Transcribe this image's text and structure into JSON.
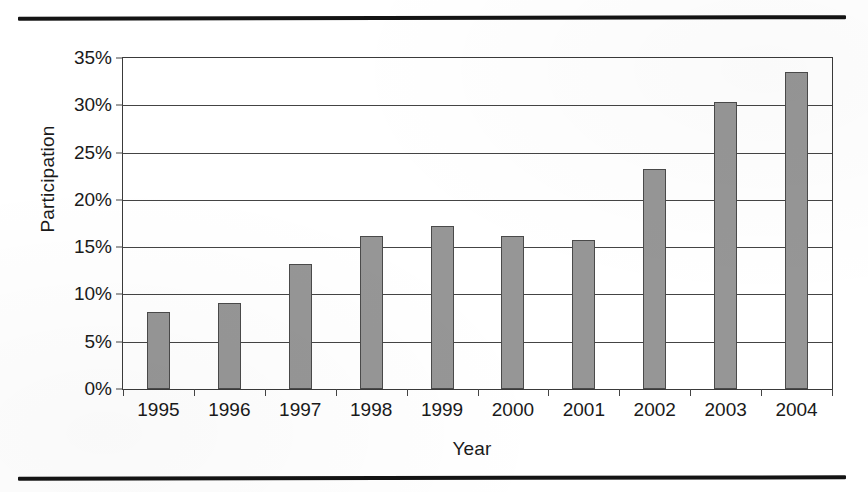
{
  "chart_data": {
    "type": "bar",
    "title": "",
    "xlabel": "Year",
    "ylabel": "Participation",
    "categories": [
      "1995",
      "1996",
      "1997",
      "1998",
      "1999",
      "2000",
      "2001",
      "2002",
      "2003",
      "2004"
    ],
    "values": [
      8.1,
      9.1,
      13.2,
      16.2,
      17.2,
      16.2,
      15.8,
      23.3,
      30.3,
      33.5
    ],
    "value_unit": "%",
    "ylim": [
      0,
      35
    ],
    "ytick_values": [
      0,
      5,
      10,
      15,
      20,
      25,
      30,
      35
    ],
    "ytick_labels": [
      "0%",
      "5%",
      "10%",
      "15%",
      "20%",
      "25%",
      "30%",
      "35%"
    ],
    "grid": true,
    "grid_axis": "y",
    "legend": false,
    "legend_position": "none",
    "bar_color": "#969696",
    "bar_border_color": "#4a4a4a",
    "axis_color": "#444444",
    "background_color": "#ffffff"
  },
  "page": {
    "rule_color": "#141414",
    "top_rule_name": "top-horizontal-rule",
    "bottom_rule_name": "bottom-horizontal-rule"
  }
}
